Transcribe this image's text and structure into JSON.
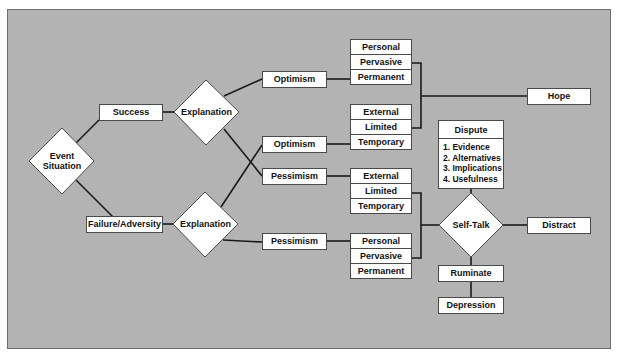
{
  "diagram": {
    "start": {
      "label_line1": "Event",
      "label_line2": "Situation"
    },
    "outcomes": {
      "success": "Success",
      "failure": "Failure/Adversity"
    },
    "explanations": {
      "top": "Explanation",
      "bottom": "Explanation"
    },
    "styles": {
      "optimism_1": "Optimism",
      "optimism_2": "Optimism",
      "pessimism_1": "Pessimism",
      "pessimism_2": "Pessimism"
    },
    "stacks": [
      {
        "cells": [
          "Personal",
          "Pervasive",
          "Permanent"
        ]
      },
      {
        "cells": [
          "External",
          "Limited",
          "Temporary"
        ]
      },
      {
        "cells": [
          "External",
          "Limited",
          "Temporary"
        ]
      },
      {
        "cells": [
          "Personal",
          "Pervasive",
          "Permanent"
        ]
      }
    ],
    "hope": "Hope",
    "dispute": {
      "title": "Dispute",
      "items": [
        "1. Evidence",
        "2. Alternatives",
        "3. Implications",
        "4. Usefulness"
      ]
    },
    "self_talk": "Self-Talk",
    "distract": "Distract",
    "ruminate": "Ruminate",
    "depression": "Depression"
  },
  "colors": {
    "background": "#b3b3b3",
    "box_fill": "#ffffff",
    "line": "#1a1a1a"
  }
}
